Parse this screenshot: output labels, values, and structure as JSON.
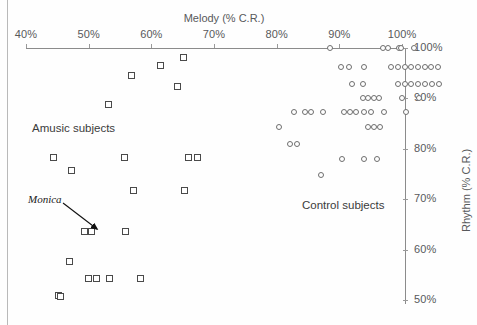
{
  "figure": {
    "background_color": "#fefefe",
    "axis_color": "#8b8b8b",
    "square_marker_color": "#4a4a4a",
    "circle_marker_color": "#6e6e6e"
  },
  "annotations": {
    "amusic_label": "Amusic subjects",
    "control_label": "Control subjects",
    "callout_label": "Monica"
  },
  "chart_data": {
    "type": "scatter",
    "title": "",
    "xlabel": "Melody (% C.R.)",
    "ylabel": "Rhythm (% C.R.)",
    "xlim": [
      40,
      100
    ],
    "ylim": [
      48,
      100
    ],
    "xticks": [
      40,
      50,
      60,
      70,
      80,
      90,
      100
    ],
    "xticklabels": [
      "40%",
      "50%",
      "60%",
      "70%",
      "80%",
      "90%",
      "100%"
    ],
    "yticks": [
      50,
      60,
      70,
      80,
      90,
      100
    ],
    "yticklabels": [
      "50%",
      "60%",
      "70%",
      "80%",
      "90%",
      "100%"
    ],
    "grid": false,
    "legend": "none",
    "x_axis_position": "top",
    "y_axis_position": "right",
    "series": [
      {
        "name": "Amusic subjects",
        "marker": "square",
        "points": [
          [
            65.1,
            98.2
          ],
          [
            61.5,
            96.5
          ],
          [
            56.9,
            94.6
          ],
          [
            64.2,
            92.3
          ],
          [
            53.1,
            88.7
          ],
          [
            44.4,
            78.2
          ],
          [
            55.7,
            78.2
          ],
          [
            66.0,
            78.2
          ],
          [
            67.4,
            78.2
          ],
          [
            47.3,
            75.6
          ],
          [
            57.1,
            71.8
          ],
          [
            65.3,
            71.8
          ],
          [
            49.3,
            63.6
          ],
          [
            50.4,
            63.6
          ],
          [
            55.8,
            63.6
          ],
          [
            47.0,
            57.6
          ],
          [
            50.0,
            54.3
          ],
          [
            51.3,
            54.3
          ],
          [
            53.4,
            54.3
          ],
          [
            58.3,
            54.3
          ],
          [
            45.2,
            50.8
          ],
          [
            45.5,
            50.6
          ]
        ]
      },
      {
        "name": "Control subjects",
        "marker": "circle",
        "points": [
          [
            88.5,
            100.0
          ],
          [
            96.9,
            100.0
          ],
          [
            97.8,
            100.0
          ],
          [
            101.9,
            100.0
          ],
          [
            99.6,
            100.0
          ],
          [
            99.9,
            100.0
          ],
          [
            90.2,
            96.2
          ],
          [
            91.6,
            96.2
          ],
          [
            93.9,
            96.2
          ],
          [
            98.2,
            96.2
          ],
          [
            99.3,
            96.2
          ],
          [
            100.4,
            96.2
          ],
          [
            101.5,
            96.2
          ],
          [
            102.5,
            96.2
          ],
          [
            103.6,
            96.2
          ],
          [
            104.7,
            96.2
          ],
          [
            105.8,
            96.2
          ],
          [
            92.1,
            92.8
          ],
          [
            93.7,
            92.8
          ],
          [
            99.4,
            92.8
          ],
          [
            100.4,
            92.8
          ],
          [
            101.5,
            92.8
          ],
          [
            102.6,
            92.8
          ],
          [
            103.7,
            92.8
          ],
          [
            104.8,
            92.8
          ],
          [
            105.9,
            92.8
          ],
          [
            93.7,
            90.1
          ],
          [
            94.6,
            90.1
          ],
          [
            95.5,
            90.1
          ],
          [
            96.4,
            90.1
          ],
          [
            100.0,
            90.1
          ],
          [
            102.7,
            90.1
          ],
          [
            82.7,
            87.4
          ],
          [
            84.5,
            87.4
          ],
          [
            85.4,
            87.4
          ],
          [
            87.4,
            87.4
          ],
          [
            90.8,
            87.4
          ],
          [
            91.7,
            87.4
          ],
          [
            92.6,
            87.4
          ],
          [
            93.9,
            87.4
          ],
          [
            95.1,
            87.4
          ],
          [
            97.2,
            87.4
          ],
          [
            100.6,
            87.4
          ],
          [
            80.4,
            84.3
          ],
          [
            94.5,
            84.3
          ],
          [
            95.6,
            84.3
          ],
          [
            96.5,
            84.3
          ],
          [
            82.2,
            81.0
          ],
          [
            83.3,
            81.0
          ],
          [
            90.5,
            78.0
          ],
          [
            94.0,
            78.0
          ],
          [
            96.0,
            78.0
          ],
          [
            87.0,
            74.8
          ]
        ]
      }
    ]
  }
}
